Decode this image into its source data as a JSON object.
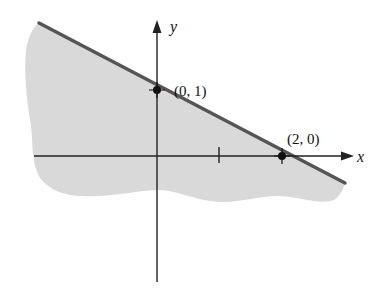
{
  "figure": {
    "axes": {
      "x_label": "x",
      "y_label": "y"
    },
    "points": [
      {
        "label": "(0, 1)",
        "x": 0,
        "y": 1
      },
      {
        "label": "(2, 0)",
        "x": 2,
        "y": 0
      }
    ],
    "tick_marks": [
      {
        "x": 1,
        "axis": "x"
      }
    ],
    "boundary_line": {
      "from": "(0, 1)",
      "to": "(2, 0)",
      "style": "solid",
      "color": "#555555"
    },
    "shaded_region": {
      "side": "below",
      "color": "#d9d9d9"
    }
  }
}
